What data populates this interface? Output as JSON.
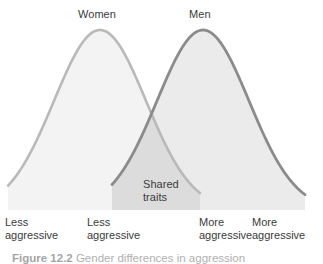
{
  "figure": {
    "background_color": "#ffffff",
    "caption_number": "Figure 12.2",
    "caption_text": "Gender differences in aggression",
    "curve_labels": {
      "left": "Women",
      "right": "Men"
    },
    "overlap_label": "Shared\ntraits",
    "axis_labels": [
      "Less\naggressive",
      "Less\naggressive",
      "More\naggressive",
      "More\naggressive"
    ]
  },
  "colors": {
    "women_stroke": "#b9b9b9",
    "women_fill": "#f3f3f3",
    "men_stroke": "#8b8b8b",
    "men_fill": "#ebebeb",
    "overlap_fill": "#dcdcdc",
    "text": "#3b3b3b",
    "caption_text": "#6e6e6e"
  },
  "chart_data": {
    "type": "area",
    "title": "",
    "subtitle": "",
    "xlabel": "",
    "ylabel": "",
    "xlim": [
      0,
      323
    ],
    "ylim": [
      0,
      1
    ],
    "grid": false,
    "legend_position": "above-curves",
    "baseline_y": 210,
    "crossing_point": {
      "x": 168,
      "y": 72
    },
    "annotations": [
      {
        "text": "Women",
        "x": 100,
        "y": 14
      },
      {
        "text": "Men",
        "x": 203,
        "y": 14
      },
      {
        "text": "Shared traits",
        "x": 160,
        "y": 190
      }
    ],
    "series": [
      {
        "name": "Women",
        "distribution": "normal",
        "mean_x": 100,
        "std_x": 46,
        "peak_y": 30,
        "start_x": 8,
        "end_x": 200,
        "stroke": "#b9b9b9",
        "fill": "#f3f3f3"
      },
      {
        "name": "Men",
        "distribution": "normal",
        "mean_x": 203,
        "std_x": 46,
        "peak_y": 30,
        "start_x": 112,
        "end_x": 305,
        "stroke": "#8b8b8b",
        "fill": "#ebebeb"
      }
    ],
    "x_tick_labels": [
      "Less aggressive",
      "Less aggressive",
      "More aggressive",
      "More aggressive"
    ],
    "x_tick_positions": [
      20,
      102,
      214,
      267
    ]
  }
}
